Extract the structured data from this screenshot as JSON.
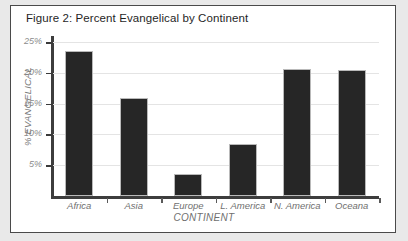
{
  "figure": {
    "title": "Figure 2: Percent Evangelical by Continent",
    "frame_color": "#4a4a4a",
    "page_background": "#e9e9e9",
    "panel_background": "#ffffff"
  },
  "chart_data": {
    "type": "bar",
    "title": "Figure 2: Percent Evangelical by Continent",
    "xlabel": "CONTINENT",
    "ylabel": "% EVANGELICAL",
    "categories": [
      "Africa",
      "Asia",
      "Europe",
      "L. America",
      "N. America",
      "Oceana"
    ],
    "values": [
      23.5,
      16.0,
      3.5,
      8.5,
      20.7,
      20.5
    ],
    "value_labels": [
      "23.5%",
      "16.0%",
      "3.5%",
      "8.5%",
      "20.7%",
      "20.5%"
    ],
    "ylim": [
      0,
      26
    ],
    "ytick_values": [
      5,
      10,
      15,
      20,
      25
    ],
    "ytick_labels": [
      "5%",
      "10%",
      "15%",
      "20%",
      "25%"
    ],
    "grid": true,
    "grid_axis": "y",
    "grid_color": "#e4e4e4",
    "legend": false,
    "bar_color": "#262626",
    "bar_edge_color": "#b9b9b9",
    "axis_color": "#3d3d3d",
    "tick_label_color": "#8c8c8c",
    "axis_title_color": "#6f6f6f"
  }
}
